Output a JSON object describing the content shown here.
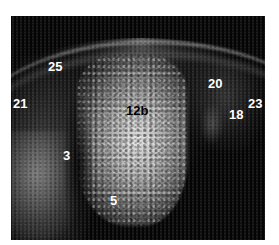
{
  "image": {
    "type": "ultrasound-scan",
    "background_color": "#050505",
    "labels": [
      {
        "id": "25",
        "text": "25",
        "x": 48,
        "y": 60,
        "color": "#ffffff"
      },
      {
        "id": "21",
        "text": "21",
        "x": 13,
        "y": 97,
        "color": "#ffffff"
      },
      {
        "id": "12b",
        "text": "12b",
        "x": 126,
        "y": 104,
        "color": "#000000"
      },
      {
        "id": "20",
        "text": "20",
        "x": 208,
        "y": 77,
        "color": "#ffffff"
      },
      {
        "id": "23",
        "text": "23",
        "x": 248,
        "y": 97,
        "color": "#ffffff"
      },
      {
        "id": "18",
        "text": "18",
        "x": 229,
        "y": 108,
        "color": "#ffffff"
      },
      {
        "id": "3",
        "text": "3",
        "x": 63,
        "y": 149,
        "color": "#ffffff"
      },
      {
        "id": "5",
        "text": "5",
        "x": 110,
        "y": 194,
        "color": "#ffffff"
      }
    ]
  }
}
